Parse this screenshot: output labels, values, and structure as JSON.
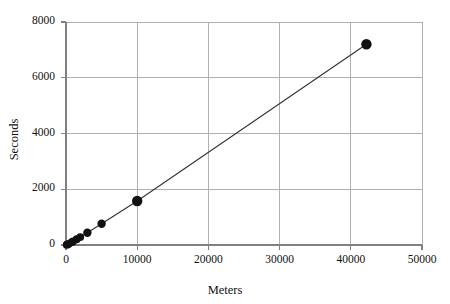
{
  "chart_data": {
    "type": "scatter",
    "title": "",
    "subtitle": "",
    "xlabel": "Meters",
    "ylabel": "Seconds",
    "xlim": [
      0,
      50000
    ],
    "ylim": [
      0,
      8000
    ],
    "xticks": [
      0,
      10000,
      20000,
      30000,
      40000,
      50000
    ],
    "yticks": [
      0,
      2000,
      4000,
      6000,
      8000
    ],
    "xtick_labels": [
      "0",
      "10000",
      "20000",
      "30000",
      "40000",
      "50000"
    ],
    "ytick_labels": [
      "0",
      "2000",
      "4000",
      "6000",
      "8000"
    ],
    "grid": true,
    "grid_color": "#b0b0b0",
    "axis_color": "#808080",
    "legend": false,
    "legend_position": "none",
    "marker": "filled-circle",
    "marker_color": "#111111",
    "line_color": "#333333",
    "connected": true,
    "series": [
      {
        "name": "World record times",
        "x": [
          100,
          200,
          400,
          800,
          1000,
          1500,
          2000,
          3000,
          5000,
          10000,
          42195
        ],
        "y": [
          10,
          19,
          43,
          101,
          132,
          206,
          285,
          440,
          760,
          1577,
          7200
        ]
      }
    ],
    "points": [
      {
        "x": 100,
        "y": 10
      },
      {
        "x": 200,
        "y": 19
      },
      {
        "x": 400,
        "y": 43
      },
      {
        "x": 800,
        "y": 101
      },
      {
        "x": 1000,
        "y": 132
      },
      {
        "x": 1500,
        "y": 206
      },
      {
        "x": 2000,
        "y": 285
      },
      {
        "x": 3000,
        "y": 440
      },
      {
        "x": 5000,
        "y": 760
      },
      {
        "x": 10000,
        "y": 1577
      },
      {
        "x": 42195,
        "y": 7200
      }
    ]
  },
  "plot": {
    "left": 66,
    "right": 422,
    "top": 22,
    "bottom": 245
  },
  "colors": {
    "background": "#ffffff",
    "grid": "#b0b0b0",
    "axis": "#808080",
    "marker": "#111111",
    "line": "#333333",
    "text": "#111111"
  }
}
